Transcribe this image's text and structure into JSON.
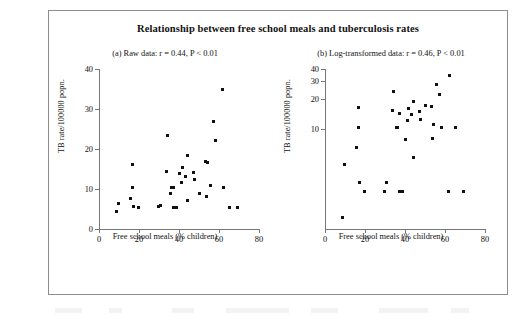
{
  "figure": {
    "title": "Relationship between free school meals and tuberculosis rates"
  },
  "panels": [
    {
      "key": "a",
      "title": "(a) Raw data: r = 0.44, P < 0.01",
      "xlabel": "Free school meals (% children)",
      "ylabel": "TB rate/100000 popn.",
      "xticks": [
        "0",
        "20",
        "40",
        "60",
        "80"
      ],
      "yticks": [
        "0",
        "10",
        "20",
        "30",
        "40"
      ]
    },
    {
      "key": "b",
      "title": "(b) Log-transformed data: r = 0.46, P < 0.01",
      "xlabel": "Free school meals (% children)",
      "ylabel": "TB rate/100000 popn.",
      "xticks": [
        "0",
        "20",
        "40",
        "60",
        "80"
      ],
      "yticks": [
        "10",
        "20",
        "30",
        "40"
      ]
    }
  ],
  "chart_data": [
    {
      "type": "scatter",
      "panel": "a",
      "title": "(a) Raw data: r = 0.44, P < 0.01",
      "xlabel": "Free school meals (% children)",
      "ylabel": "TB rate/100000 popn.",
      "xlim": [
        0,
        80
      ],
      "ylim": [
        0,
        40
      ],
      "yscale": "linear",
      "grid": false,
      "legend": null,
      "correlation_r": 0.44,
      "p_value": "< 0.01",
      "x": [
        8.6,
        9.8,
        15.5,
        16.6,
        16.8,
        17.0,
        19.9,
        29.6,
        30.6,
        33.8,
        34.2,
        35.6,
        36.4,
        37.2,
        37.4,
        38.6,
        40.4,
        41.0,
        41.6,
        43.4,
        44.2,
        44.4,
        47.0,
        47.6,
        50.2,
        53.2,
        53.6,
        54.2,
        55.8,
        57.4,
        58.4,
        61.6,
        62.0,
        65.0,
        69.0
      ],
      "y": [
        4.3,
        6.4,
        7.6,
        10.5,
        16.1,
        5.7,
        5.5,
        5.6,
        5.9,
        14.5,
        23.3,
        9.0,
        10.4,
        5.5,
        10.5,
        5.5,
        13.8,
        11.6,
        15.5,
        13.2,
        18.5,
        7.2,
        14.2,
        12.3,
        9.0,
        16.8,
        8.1,
        16.6,
        11.0,
        27.0,
        22.2,
        34.8,
        10.5,
        5.5,
        5.4
      ]
    },
    {
      "type": "scatter",
      "panel": "b",
      "title": "(b) Log-transformed data: r = 0.46, P < 0.01",
      "xlabel": "Free school meals (% children)",
      "ylabel": "TB rate/100000 popn.",
      "xlim": [
        0,
        80
      ],
      "ylim": [
        1.0,
        40
      ],
      "yscale": "log",
      "grid": false,
      "legend": null,
      "correlation_r": 0.46,
      "p_value": "< 0.01",
      "x": [
        8.6,
        9.8,
        15.5,
        16.6,
        16.8,
        17.0,
        19.9,
        29.6,
        30.6,
        33.8,
        34.2,
        35.6,
        36.4,
        37.2,
        37.4,
        38.6,
        40.4,
        41.0,
        41.6,
        43.4,
        44.2,
        44.4,
        47.0,
        47.6,
        50.2,
        53.2,
        53.6,
        54.2,
        55.8,
        57.4,
        58.4,
        61.6,
        62.0,
        65.0,
        69.0
      ],
      "y": [
        1.3,
        4.4,
        6.6,
        10.4,
        16.4,
        2.9,
        2.4,
        2.4,
        2.9,
        15.2,
        23.6,
        10.4,
        10.4,
        2.4,
        14.4,
        2.4,
        7.9,
        12.1,
        16.0,
        14.0,
        18.8,
        5.2,
        14.9,
        12.6,
        17.2,
        16.9,
        8.0,
        11.0,
        27.8,
        22.3,
        10.5,
        2.4,
        34.8,
        10.5,
        2.4
      ]
    }
  ]
}
